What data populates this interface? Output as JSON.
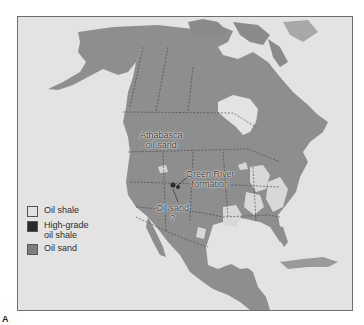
{
  "map": {
    "region": "North America",
    "labels": {
      "athabasca": [
        "Athabasca",
        "oil sand"
      ],
      "green_river": [
        "Green River",
        "formation"
      ],
      "oil_sand_q": [
        "Oil sand",
        "?"
      ]
    }
  },
  "legend": {
    "items": [
      {
        "label_lines": [
          "Oil shale"
        ],
        "color": "#e2e2e2"
      },
      {
        "label_lines": [
          "High-grade",
          "oil shale"
        ],
        "color": "#2a2a2a"
      },
      {
        "label_lines": [
          "Oil sand"
        ],
        "color": "#7e7e7e"
      }
    ]
  },
  "figure_label": "A",
  "colors": {
    "ocean": "#e3e3e3",
    "land": "#8e8e8e",
    "land_dark": "#7c7c7c",
    "oil_shale": "#d8d8d8",
    "border": "#3c3c3c"
  }
}
